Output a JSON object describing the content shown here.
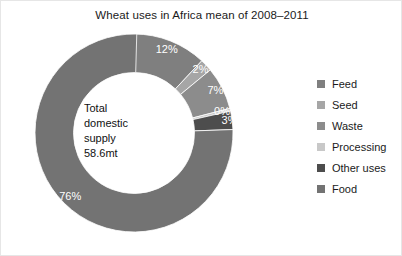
{
  "chart_data": {
    "type": "pie",
    "title": "Wheat uses in Africa mean of 2008–2011",
    "subtitle": "",
    "xlabel": "",
    "ylabel": "",
    "donut": true,
    "start_angle_deg": 0,
    "direction": "clockwise",
    "grid": false,
    "legend_position": "right",
    "categories": [
      "Feed",
      "Seed",
      "Waste",
      "Processing",
      "Other uses",
      "Food"
    ],
    "values": [
      12,
      2,
      7,
      0,
      3,
      76
    ],
    "value_labels": [
      "12%",
      "2%",
      "7%",
      "0%",
      "3%",
      "76%"
    ],
    "colors": [
      "#7f7f7f",
      "#a6a6a6",
      "#8c8c8c",
      "#c8c8c8",
      "#4d4d4d",
      "#737373"
    ],
    "center_annotation": [
      "Total",
      "domestic",
      "supply",
      "58.6mt"
    ],
    "units": "mt",
    "total": "58.6mt"
  },
  "legend": {
    "items": [
      {
        "label": "Feed",
        "color": "#7f7f7f"
      },
      {
        "label": "Seed",
        "color": "#a6a6a6"
      },
      {
        "label": "Waste",
        "color": "#8c8c8c"
      },
      {
        "label": "Processing",
        "color": "#c8c8c8"
      },
      {
        "label": "Other uses",
        "color": "#4d4d4d"
      },
      {
        "label": "Food",
        "color": "#737373"
      }
    ]
  }
}
